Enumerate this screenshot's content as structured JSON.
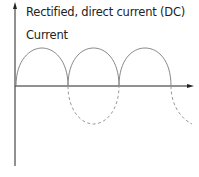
{
  "diagram": {
    "title": "Rectified, direct current (DC)",
    "y_axis_label": "Current",
    "waveform": "full-wave rectified sine",
    "solid_arches": 3,
    "dashed_inverted_lobes": 2,
    "colors": {
      "axis": "#222222",
      "solid_wave": "#888888",
      "dashed_wave": "#999999"
    }
  }
}
